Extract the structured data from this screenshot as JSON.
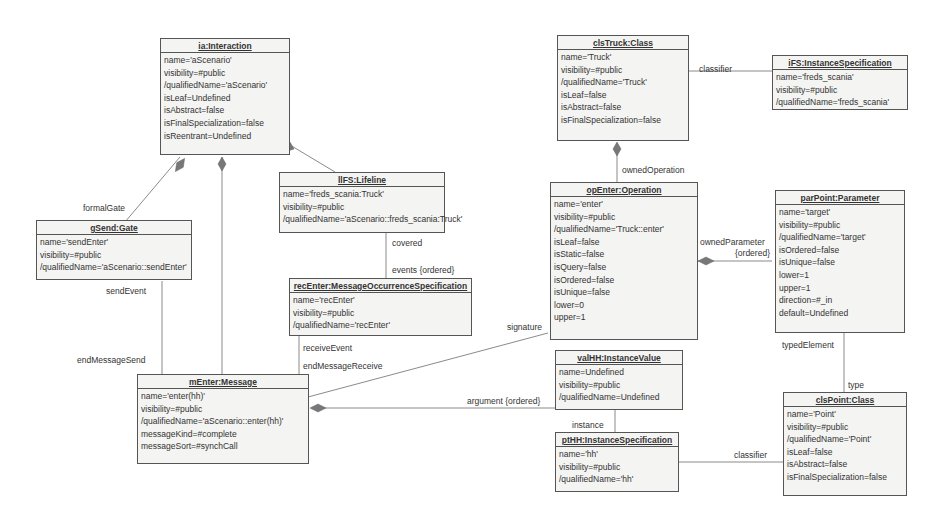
{
  "boxes": {
    "interaction": {
      "title": "ia:Interaction",
      "attrs": [
        "name='aScenario'",
        "visibility=#public",
        "/qualifiedName='aScenario'",
        "isLeaf=Undefined",
        "isAbstract=false",
        "isFinalSpecialization=false",
        "isReentrant=Undefined"
      ]
    },
    "clsTruck": {
      "title": "clsTruck:Class",
      "attrs": [
        "name='Truck'",
        "visibility=#public",
        "/qualifiedName='Truck'",
        "isLeaf=false",
        "isAbstract=false",
        "isFinalSpecialization=false"
      ]
    },
    "iFS": {
      "title": "iFS:InstanceSpecification",
      "attrs": [
        "name='freds_scania'",
        "visibility=#public",
        "/qualifiedName='freds_scania'"
      ]
    },
    "lifeline": {
      "title": "llFS:Lifeline",
      "attrs": [
        "name='freds_scania:Truck'",
        "visibility=#public",
        "/qualifiedName='aScenario::freds_scania:Truck'"
      ]
    },
    "gate": {
      "title": "gSend:Gate",
      "attrs": [
        "name='sendEnter'",
        "visibility=#public",
        "/qualifiedName='aScenario::sendEnter'"
      ]
    },
    "recEnter": {
      "title": "recEnter:MessageOccurrenceSpecification",
      "attrs": [
        "name='recEnter'",
        "visibility=#public",
        "/qualifiedName='recEnter'"
      ]
    },
    "operation": {
      "title": "opEnter:Operation",
      "attrs": [
        "name='enter'",
        "visibility=#public",
        "/qualifiedName='Truck::enter'",
        "isLeaf=false",
        "isStatic=false",
        "isQuery=false",
        "isOrdered=false",
        "isUnique=false",
        "lower=0",
        "upper=1"
      ]
    },
    "parameter": {
      "title": "parPoint:Parameter",
      "attrs": [
        "name='target'",
        "visibility=#public",
        "/qualifiedName='target'",
        "isOrdered=false",
        "isUnique=false",
        "lower=1",
        "upper=1",
        "direction=#_in",
        "default=Undefined"
      ]
    },
    "message": {
      "title": "mEnter:Message",
      "attrs": [
        "name='enter(hh)'",
        "visibility=#public",
        "/qualifiedName='aScenario::enter(hh)'",
        "messageKind=#complete",
        "messageSort=#synchCall"
      ]
    },
    "valHH": {
      "title": "valHH:InstanceValue",
      "attrs": [
        "name=Undefined",
        "visibility=#public",
        "/qualifiedName=Undefined"
      ]
    },
    "ptHH": {
      "title": "ptHH:InstanceSpecification",
      "attrs": [
        "name='hh'",
        "visibility=#public",
        "/qualifiedName='hh'"
      ]
    },
    "clsPoint": {
      "title": "clsPoint:Class",
      "attrs": [
        "name='Point'",
        "visibility=#public",
        "/qualifiedName='Point'",
        "isLeaf=false",
        "isAbstract=false",
        "isFinalSpecialization=false"
      ]
    }
  },
  "labels": {
    "formalGate": "formalGate",
    "sendEvent": "sendEvent",
    "endMessageSend": "endMessageSend",
    "covered": "covered",
    "events": "events {ordered}",
    "receiveEvent": "receiveEvent",
    "endMessageReceive": "endMessageReceive",
    "signature": "signature",
    "argument": "argument {ordered}",
    "instance": "instance",
    "classifier1": "classifier",
    "classifier2": "classifier",
    "ownedOperation": "ownedOperation",
    "ownedParameter": "ownedParameter",
    "ownedParameterOrdered": "{ordered}",
    "typedElement": "typedElement",
    "type": "type"
  },
  "colors": {
    "line": "#888888",
    "border": "#555555",
    "fill": "#f4f4f2",
    "diamond": "#777777"
  }
}
